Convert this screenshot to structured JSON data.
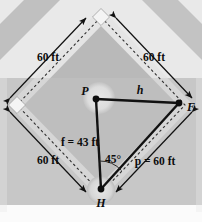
{
  "figure": {
    "name": "baseball-diamond-geometry-diagram",
    "caption_text": "",
    "colors": {
      "page_background": "#ffffff",
      "field_background": "#c8c8c8",
      "infield_fill": "#b4b4b4",
      "outfield_wedge": "#b0b0b0",
      "base_square_fill": "#f2f2f2",
      "mound_fill": "#dcdcdc",
      "line_color": "#111111",
      "dashed_line_color": "#3a3a3a",
      "bottom_strip": "#f2f2f2"
    }
  },
  "vertices": [
    {
      "id": "P",
      "label": "P",
      "name": "pitcher-point",
      "x": 96,
      "y": 99
    },
    {
      "id": "F",
      "label": "F",
      "name": "first-base-point",
      "x": 180,
      "y": 103
    },
    {
      "id": "H",
      "label": "H",
      "name": "home-plate-point",
      "x": 101,
      "y": 190
    }
  ],
  "segments": [
    {
      "id": "h",
      "label": "h",
      "name": "segment-p-to-f",
      "from": "P",
      "to": "F"
    },
    {
      "id": "f",
      "label": "f = 43 ft",
      "name": "segment-p-to-h",
      "from": "P",
      "to": "H"
    },
    {
      "id": "p",
      "label": "p = 60 ft",
      "name": "segment-h-to-f",
      "from": "H",
      "to": "F"
    }
  ],
  "angle": {
    "label": "45°",
    "name": "angle-at-home-plate",
    "value_degrees": 45,
    "at_vertex": "H"
  },
  "dimensions": [
    {
      "id": "dim-top-left",
      "label": "60 ft",
      "name": "dimension-third-to-second"
    },
    {
      "id": "dim-top-right",
      "label": "60 ft",
      "name": "dimension-second-to-first"
    },
    {
      "id": "dim-bottom-left",
      "label": "60 ft",
      "name": "dimension-home-to-third"
    }
  ],
  "dimension_extra": {
    "label": "60 ft",
    "name": "dimension-first-to-home"
  }
}
